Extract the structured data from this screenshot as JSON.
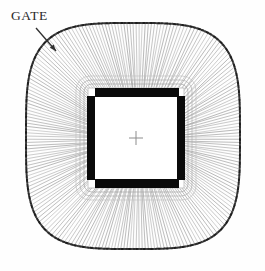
{
  "figure": {
    "name": "wire-bond-package-top-view",
    "background_color": "#fefefe",
    "width": 265,
    "height": 271
  },
  "annotations": {
    "gate": {
      "label": "GATE",
      "text_color": "#2b2b2b",
      "arrow_color": "#2f2f2f",
      "arrow_from_x": 36,
      "arrow_from_y": 28,
      "arrow_to_x": 56,
      "arrow_to_y": 51
    }
  },
  "package_rim": {
    "name": "lead-frame-rim",
    "color": "#1d1d1d",
    "center_x": 133,
    "center_y": 136,
    "half_width": 107,
    "half_height": 113,
    "corner_exponent": 3.6
  },
  "bond_wires": {
    "name": "bond-wire-fan",
    "color": "#6a6a6a",
    "count": 220,
    "line_width": 0.55
  },
  "die": {
    "name": "silicon-die",
    "fill": "#ffffff",
    "outline_color": "#b9b9b9",
    "left": 88,
    "top": 88,
    "right": 184,
    "bottom": 188
  },
  "die_frame_rings": [
    {
      "inset": -12,
      "radius": 14,
      "color": "#c2c2c2"
    },
    {
      "inset": -8,
      "radius": 11,
      "color": "#b0b0b0"
    },
    {
      "inset": -4,
      "radius": 8,
      "color": "#a8a8a8"
    }
  ],
  "bond_pads": [
    {
      "name": "bond-pad-top",
      "x": 95,
      "y": 88,
      "width": 84,
      "height": 9,
      "color": "#0a0a0a"
    },
    {
      "name": "bond-pad-bottom",
      "x": 95,
      "y": 179,
      "width": 84,
      "height": 9,
      "color": "#0a0a0a"
    },
    {
      "name": "bond-pad-left",
      "x": 87,
      "y": 96,
      "width": 8,
      "height": 84,
      "color": "#0a0a0a"
    },
    {
      "name": "bond-pad-right",
      "x": 177,
      "y": 96,
      "width": 8,
      "height": 84,
      "color": "#0a0a0a"
    }
  ],
  "center_crosshair": {
    "name": "die-center-crosshair",
    "x": 136,
    "y": 138,
    "arm_length": 7,
    "color": "#8d8d8d"
  }
}
